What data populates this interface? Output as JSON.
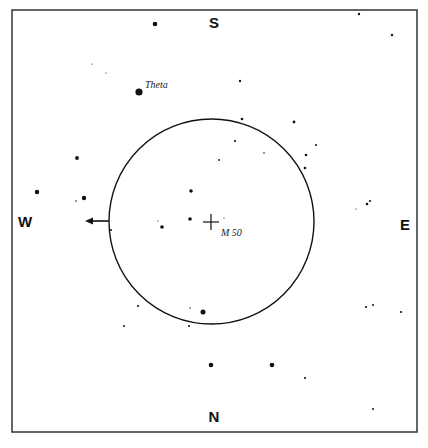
{
  "chart_data": {
    "type": "scatter",
    "title": "",
    "frame": {
      "x": 12,
      "y": 10,
      "width": 405,
      "height": 422,
      "stroke": "#333333"
    },
    "directions": {
      "south": {
        "label": "S",
        "x": 214,
        "y": 28
      },
      "north": {
        "label": "N",
        "x": 214,
        "y": 422
      },
      "west": {
        "label": "W",
        "x": 25,
        "y": 227
      },
      "east": {
        "label": "E",
        "x": 405,
        "y": 230
      }
    },
    "field_circle": {
      "cx": 211.5,
      "cy": 221.5,
      "r": 102.5,
      "stroke": "#111111"
    },
    "target": {
      "label": "M 50",
      "x": 211,
      "y": 222,
      "marker": "crosshair",
      "label_x": 221,
      "label_y": 236
    },
    "arrow": {
      "direction": "west",
      "x1": 109,
      "y1": 221,
      "x2": 86,
      "y2": 221
    },
    "labeled_stars": [
      {
        "label": "Theta",
        "x": 139,
        "y": 92,
        "r": 3.6,
        "label_x": 145,
        "label_y": 88
      }
    ],
    "stars": [
      {
        "x": 155,
        "y": 24,
        "r": 2.3
      },
      {
        "x": 359,
        "y": 14,
        "r": 1.2
      },
      {
        "x": 392,
        "y": 35,
        "r": 1.2
      },
      {
        "x": 92,
        "y": 64,
        "r": 0.6
      },
      {
        "x": 106,
        "y": 73,
        "r": 0.6
      },
      {
        "x": 240,
        "y": 81,
        "r": 1.2
      },
      {
        "x": 242,
        "y": 119,
        "r": 1.3
      },
      {
        "x": 294,
        "y": 122,
        "r": 1.4
      },
      {
        "x": 235,
        "y": 141,
        "r": 1.1
      },
      {
        "x": 264,
        "y": 153,
        "r": 0.8
      },
      {
        "x": 316,
        "y": 145,
        "r": 1.0
      },
      {
        "x": 306,
        "y": 155,
        "r": 1.3
      },
      {
        "x": 305,
        "y": 168,
        "r": 1.3
      },
      {
        "x": 219,
        "y": 160,
        "r": 0.9
      },
      {
        "x": 77,
        "y": 158,
        "r": 1.9
      },
      {
        "x": 37,
        "y": 192,
        "r": 2.2
      },
      {
        "x": 84,
        "y": 198,
        "r": 2.2
      },
      {
        "x": 76,
        "y": 201,
        "r": 0.8
      },
      {
        "x": 191,
        "y": 191,
        "r": 1.8
      },
      {
        "x": 190,
        "y": 219,
        "r": 1.8
      },
      {
        "x": 162,
        "y": 227,
        "r": 1.8
      },
      {
        "x": 158,
        "y": 221,
        "r": 0.6
      },
      {
        "x": 224,
        "y": 218,
        "r": 0.6
      },
      {
        "x": 111,
        "y": 230,
        "r": 1.0
      },
      {
        "x": 367,
        "y": 204,
        "r": 1.3
      },
      {
        "x": 370,
        "y": 201,
        "r": 1.1
      },
      {
        "x": 356,
        "y": 209,
        "r": 0.6
      },
      {
        "x": 138,
        "y": 306,
        "r": 1.1
      },
      {
        "x": 124,
        "y": 326,
        "r": 1.0
      },
      {
        "x": 190,
        "y": 308,
        "r": 0.7
      },
      {
        "x": 203,
        "y": 312,
        "r": 2.5
      },
      {
        "x": 189,
        "y": 326,
        "r": 1.0
      },
      {
        "x": 366,
        "y": 307,
        "r": 1.1
      },
      {
        "x": 373,
        "y": 305,
        "r": 1.0
      },
      {
        "x": 401,
        "y": 312,
        "r": 1.1
      },
      {
        "x": 211,
        "y": 365,
        "r": 2.3
      },
      {
        "x": 272,
        "y": 365,
        "r": 2.3
      },
      {
        "x": 305,
        "y": 378,
        "r": 1.1
      },
      {
        "x": 373,
        "y": 409,
        "r": 1.0
      }
    ]
  },
  "labels": {
    "south": "S",
    "north": "N",
    "west": "W",
    "east": "E",
    "target": "M 50",
    "theta": "Theta"
  }
}
